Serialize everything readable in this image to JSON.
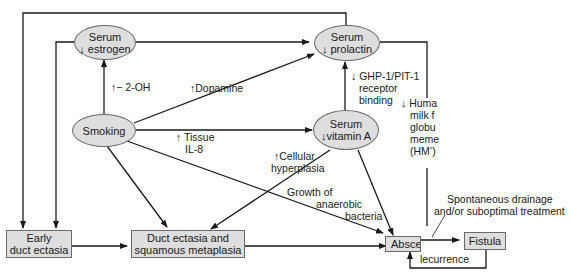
{
  "nodes": {
    "serum_estrogen": {
      "line1": "Serum",
      "line2": "↓ estrogen"
    },
    "serum_prolactin": {
      "line1": "Serum",
      "line2": "↓ prolactin"
    },
    "smoking": {
      "label": "Smoking"
    },
    "serum_vitamin_a": {
      "line1": "Serum",
      "line2": "↓vitamin A"
    },
    "early_duct_ectasia": {
      "line1": "Early",
      "line2": "duct ectasia"
    },
    "duct_ectasia_squamous": {
      "line1": "Duct ectasia and",
      "line2": "squamous metaplasia"
    },
    "abscess": {
      "label": "Absce"
    },
    "fistula": {
      "label": "Fistula"
    }
  },
  "edge_labels": {
    "two_oh": "↑− 2-OH",
    "dopamine": "↑Dopamine",
    "tissue_il8_1": "↑ Tissue",
    "tissue_il8_2": "IL-8",
    "ghp_1": "↓ GHP-1/PIT-1",
    "ghp_2": "receptor",
    "ghp_3": "binding",
    "hmfg_1": "↓ Huma",
    "hmfg_2": "milk f",
    "hmfg_3": "globu",
    "hmfg_4": "meme",
    "hmfg_5": "(HM’)",
    "cellular_1": "↑Cellular",
    "cellular_2": "hyperplasia",
    "growth_1": "Growth of",
    "growth_2": "anaerobic",
    "growth_3": "bacteria",
    "spontaneous_1": "Spontaneous drainage",
    "spontaneous_2": "and/or suboptimal treatment",
    "recurrence": "lecurrence"
  },
  "colors": {
    "node_fill": "#dedede",
    "node_border": "#6a6a6a",
    "edge": "#1a1a1a"
  }
}
